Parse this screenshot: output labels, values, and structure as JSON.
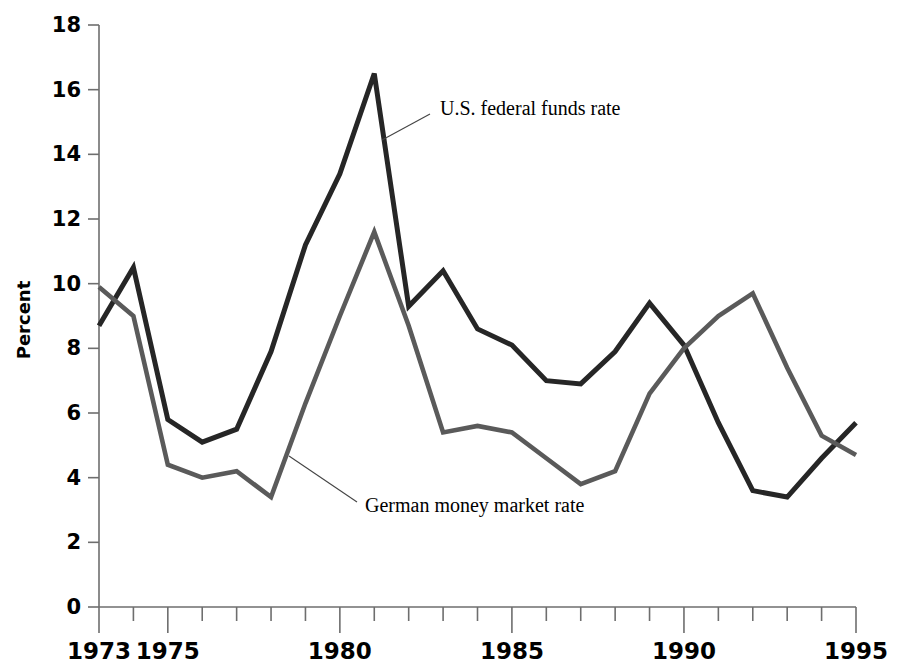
{
  "chart_data": {
    "type": "line",
    "title": "",
    "xlabel": "",
    "ylabel": "Percent",
    "xlim": [
      1973,
      1995
    ],
    "ylim": [
      0,
      18
    ],
    "grid": false,
    "legend_position": "inline-annotation",
    "y_ticks": [
      0,
      2,
      4,
      6,
      8,
      10,
      12,
      14,
      16,
      18
    ],
    "y_tick_labels": [
      "0",
      "2",
      "4",
      "6",
      "8",
      "10",
      "12",
      "14",
      "16",
      "18"
    ],
    "x_ticks": [
      1973,
      1974,
      1975,
      1976,
      1977,
      1978,
      1979,
      1980,
      1981,
      1982,
      1983,
      1984,
      1985,
      1986,
      1987,
      1988,
      1989,
      1990,
      1991,
      1992,
      1993,
      1994,
      1995
    ],
    "x_tick_labels_shown": [
      "1973",
      "1975",
      "1980",
      "1985",
      "1990",
      "1995"
    ],
    "x_labeled_ticks": [
      1973,
      1975,
      1980,
      1985,
      1990,
      1995
    ],
    "x": [
      1973,
      1974,
      1975,
      1976,
      1977,
      1978,
      1979,
      1980,
      1981,
      1982,
      1983,
      1984,
      1985,
      1986,
      1987,
      1988,
      1989,
      1990,
      1991,
      1992,
      1993,
      1994,
      1995
    ],
    "series": [
      {
        "name": "U.S. federal funds rate",
        "color": "#262626",
        "width": 5.0,
        "values": [
          8.7,
          10.5,
          5.8,
          5.1,
          5.5,
          7.9,
          11.2,
          13.4,
          16.5,
          9.3,
          10.4,
          8.6,
          8.1,
          7.0,
          6.9,
          7.9,
          9.4,
          8.1,
          5.7,
          3.6,
          3.4,
          4.6,
          5.7
        ]
      },
      {
        "name": "German money market rate",
        "color": "#5a5a5a",
        "width": 4.6,
        "values": [
          9.9,
          9.0,
          4.4,
          4.0,
          4.2,
          3.4,
          6.3,
          9.0,
          11.6,
          8.7,
          5.4,
          5.6,
          5.4,
          4.6,
          3.8,
          4.2,
          6.6,
          8.0,
          9.0,
          9.7,
          7.4,
          5.3,
          4.7
        ]
      }
    ],
    "annotations": [
      {
        "label": "U.S. federal funds rate",
        "text_x": 440,
        "text_y": 110,
        "leader_from_x": 430,
        "leader_from_y": 114,
        "leader_to_x": 382,
        "leader_to_y": 140
      },
      {
        "label": "German money market rate",
        "text_x": 365,
        "text_y": 507,
        "leader_from_x": 357,
        "leader_from_y": 502,
        "leader_to_x": 289,
        "leader_to_y": 456
      }
    ]
  },
  "axis": {
    "y_label": "Percent"
  }
}
